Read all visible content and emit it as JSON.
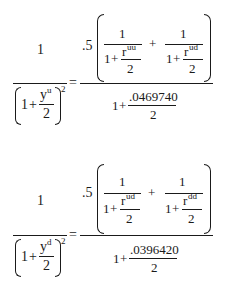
{
  "equations": [
    {
      "lhs": {
        "numerator": "1",
        "denom_one": "1",
        "denom_plus": "+",
        "y_var": "y",
        "y_sup": "u",
        "y_den": "2",
        "exponent": "2"
      },
      "equals": "=",
      "rhs": {
        "coefficient": ".5",
        "term1": {
          "num": "1",
          "one": "1",
          "plus": "+",
          "r_var": "r",
          "r_sup": "uu",
          "r_den": "2"
        },
        "between_plus": "+",
        "term2": {
          "num": "1",
          "one": "1",
          "plus": "+",
          "r_var": "r",
          "r_sup": "ud",
          "r_den": "2"
        },
        "denom_one": "1",
        "denom_plus": "+",
        "rate": ".0469740",
        "rate_den": "2"
      }
    },
    {
      "lhs": {
        "numerator": "1",
        "denom_one": "1",
        "denom_plus": "+",
        "y_var": "y",
        "y_sup": "d",
        "y_den": "2",
        "exponent": "2"
      },
      "equals": "=",
      "rhs": {
        "coefficient": ".5",
        "term1": {
          "num": "1",
          "one": "1",
          "plus": "+",
          "r_var": "r",
          "r_sup": "ud",
          "r_den": "2"
        },
        "between_plus": "+",
        "term2": {
          "num": "1",
          "one": "1",
          "plus": "+",
          "r_var": "r",
          "r_sup": "dd",
          "r_den": "2"
        },
        "denom_one": "1",
        "denom_plus": "+",
        "rate": ".0396420",
        "rate_den": "2"
      }
    }
  ]
}
